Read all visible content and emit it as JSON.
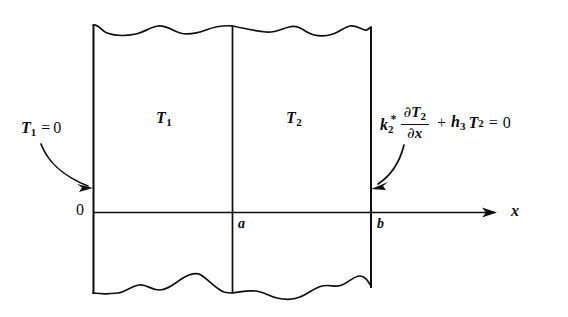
{
  "figure": {
    "background_color": "#ffffff",
    "line_color": "#0d0d0d"
  },
  "regions": {
    "left": {
      "label": "T",
      "subscript": "1"
    },
    "right": {
      "label": "T",
      "subscript": "2"
    }
  },
  "axis": {
    "label": "x",
    "ticks": [
      {
        "name": "origin",
        "label": "0",
        "x": 93
      },
      {
        "name": "interface",
        "label": "a",
        "x": 232
      },
      {
        "name": "outer-face",
        "label": "b",
        "x": 371
      }
    ],
    "y": 212,
    "arrow_end_x": 497
  },
  "boundary_conditions": {
    "left": {
      "variable": "T",
      "subscript": "1",
      "operator": "=",
      "value": "0",
      "full_text": "T1 = 0"
    },
    "right": {
      "conductivity": "k",
      "conductivity_subscript": "2",
      "conductivity_superscript": "*",
      "derivative_numerator_partial": "∂",
      "derivative_numerator_var": "T",
      "derivative_numerator_subscript": "2",
      "derivative_denominator_partial": "∂",
      "derivative_denominator_var": "x",
      "plus": "+",
      "coefficient": "h",
      "coefficient_subscript": "3",
      "temperature": "T",
      "temperature_subscript": "2",
      "equals": "=",
      "value": "0",
      "full_text": "k2* ∂T2/∂x + h3 T2 = 0"
    }
  },
  "geometry": {
    "wall_left_x": 93,
    "wall_middle_x": 232,
    "wall_right_x": 371,
    "wall_top_y": 25,
    "wall_bottom_y": 293
  }
}
